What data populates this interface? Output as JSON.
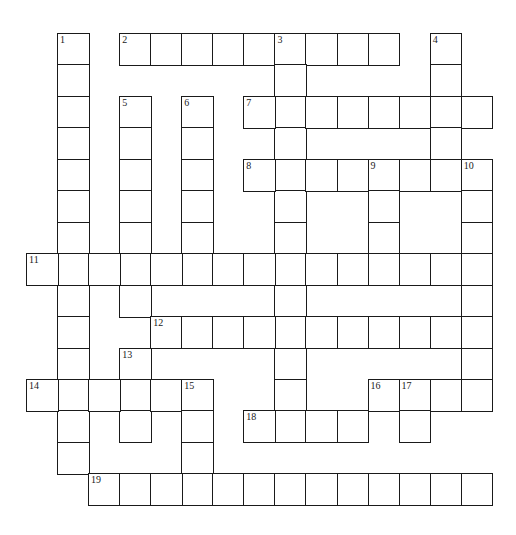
{
  "puzzle": {
    "type": "crossword",
    "grid": {
      "origin_x": 26,
      "origin_y": 33,
      "cell_w": 31.05,
      "cell_h": 31.45,
      "cols": 15,
      "rows": 15,
      "line_color": "#1a1a1a",
      "fill_color": "#ffffff"
    },
    "entries": [
      {
        "number": "1",
        "direction": "down",
        "row": 0,
        "col": 1,
        "length": 14
      },
      {
        "number": "2",
        "direction": "across",
        "row": 0,
        "col": 3,
        "length": 9
      },
      {
        "number": "3",
        "direction": "down",
        "row": 0,
        "col": 8,
        "length": 13
      },
      {
        "number": "4",
        "direction": "down",
        "row": 0,
        "col": 13,
        "length": 5
      },
      {
        "number": "5",
        "direction": "down",
        "row": 2,
        "col": 3,
        "length": 7
      },
      {
        "number": "6",
        "direction": "down",
        "row": 2,
        "col": 5,
        "length": 6
      },
      {
        "number": "7",
        "direction": "across",
        "row": 2,
        "col": 7,
        "length": 8
      },
      {
        "number": "8",
        "direction": "across",
        "row": 4,
        "col": 7,
        "length": 7
      },
      {
        "number": "9",
        "direction": "down",
        "row": 4,
        "col": 11,
        "length": 4
      },
      {
        "number": "10",
        "direction": "down",
        "row": 4,
        "col": 14,
        "length": 8
      },
      {
        "number": "11",
        "direction": "across",
        "row": 7,
        "col": 0,
        "length": 15
      },
      {
        "number": "12",
        "direction": "across",
        "row": 9,
        "col": 4,
        "length": 11
      },
      {
        "number": "13",
        "direction": "down",
        "row": 10,
        "col": 3,
        "length": 3
      },
      {
        "number": "14",
        "direction": "across",
        "row": 11,
        "col": 0,
        "length": 6
      },
      {
        "number": "15",
        "direction": "down",
        "row": 11,
        "col": 5,
        "length": 4
      },
      {
        "number": "16",
        "direction": "across",
        "row": 11,
        "col": 11,
        "length": 4
      },
      {
        "number": "17",
        "direction": "down",
        "row": 11,
        "col": 12,
        "length": 2
      },
      {
        "number": "18",
        "direction": "across",
        "row": 12,
        "col": 7,
        "length": 4
      },
      {
        "number": "19",
        "direction": "across",
        "row": 14,
        "col": 2,
        "length": 13
      }
    ]
  }
}
